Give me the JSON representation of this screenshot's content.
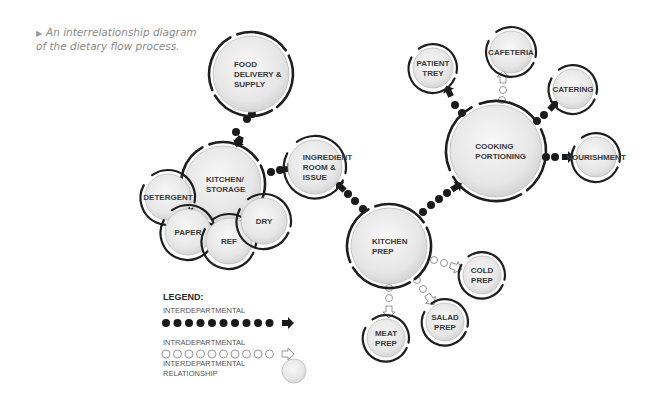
{
  "caption": {
    "marker": "▶",
    "text": "An interrelationship diagram of the dietary flow process."
  },
  "colors": {
    "node_fill_center": "#f6f6f6",
    "node_fill_edge": "#d4d4d4",
    "ring": "#1e1e1e",
    "inter_dot": "#1a1a1a",
    "intra_dot_stroke": "#8a8a8a",
    "label": "#3a3a3a"
  },
  "nodes": [
    {
      "id": "food-delivery",
      "lines": [
        "FOOD",
        "DELIVERY  &",
        "SUPPLY"
      ],
      "cx": 251,
      "cy": 74,
      "r": 38
    },
    {
      "id": "kitchen-storage",
      "lines": [
        "KITCHEN/",
        "STORAGE"
      ],
      "cx": 223,
      "cy": 184,
      "r": 38
    },
    {
      "id": "detergent",
      "lines": [
        "DETERGENT"
      ],
      "cx": 168,
      "cy": 197,
      "r": 23
    },
    {
      "id": "paper",
      "lines": [
        "PAPER"
      ],
      "cx": 188,
      "cy": 232,
      "r": 23
    },
    {
      "id": "ref",
      "lines": [
        "REF"
      ],
      "cx": 229,
      "cy": 241,
      "r": 23
    },
    {
      "id": "dry",
      "lines": [
        "DRY"
      ],
      "cx": 264,
      "cy": 221,
      "r": 23
    },
    {
      "id": "ingredient-room",
      "lines": [
        "INGREDIENT",
        "ROOM  &",
        "ISSUE"
      ],
      "cx": 315,
      "cy": 167,
      "r": 27
    },
    {
      "id": "kitchen-prep",
      "lines": [
        "KITCHEN",
        "PREP"
      ],
      "cx": 389,
      "cy": 246,
      "r": 38
    },
    {
      "id": "cooking-portioning",
      "lines": [
        "COOKING",
        "PORTIONING"
      ],
      "cx": 496,
      "cy": 151,
      "r": 46
    },
    {
      "id": "patient-trey",
      "lines": [
        "PATIENT",
        "TREY"
      ],
      "cx": 433,
      "cy": 68,
      "r": 20
    },
    {
      "id": "cafeteria",
      "lines": [
        "CAFETERIA"
      ],
      "cx": 511,
      "cy": 52,
      "r": 21
    },
    {
      "id": "catering",
      "lines": [
        "CATERING"
      ],
      "cx": 573,
      "cy": 89,
      "r": 20
    },
    {
      "id": "nourishment",
      "lines": [
        "NOURISHMENT"
      ],
      "cx": 596,
      "cy": 157,
      "r": 20
    },
    {
      "id": "cold-prep",
      "lines": [
        "COLD",
        "PREP"
      ],
      "cx": 482,
      "cy": 275,
      "r": 19
    },
    {
      "id": "salad-prep",
      "lines": [
        "SALAD",
        "PREP"
      ],
      "cx": 445,
      "cy": 322,
      "r": 19
    },
    {
      "id": "meat-prep",
      "lines": [
        "MEAT",
        "PREP"
      ],
      "cx": 386,
      "cy": 338,
      "r": 19
    }
  ],
  "connections": {
    "interdepartmental": [
      {
        "from": "kitchen-storage",
        "to": "food-delivery",
        "points": [
          [
            239,
            141
          ],
          [
            236,
            132
          ],
          [
            247,
            119
          ],
          [
            252,
            114
          ]
        ],
        "arrow_at": [
          239,
          141
        ]
      },
      {
        "from": "kitchen-storage",
        "to": "ingredient-room",
        "points": [
          [
            271,
            172
          ],
          [
            280,
            170
          ]
        ],
        "arrow_at": [
          287,
          169
        ]
      },
      {
        "from": "kitchen-prep",
        "to": "ingredient-room",
        "points": [
          [
            363,
            209
          ],
          [
            355,
            201
          ],
          [
            348,
            194
          ]
        ],
        "arrow_at": [
          341,
          187
        ]
      },
      {
        "from": "kitchen-prep",
        "to": "cooking-portioning",
        "points": [
          [
            423,
            212
          ],
          [
            431,
            205
          ],
          [
            439,
            199
          ],
          [
            447,
            193
          ]
        ],
        "arrow_at": [
          456,
          187
        ]
      },
      {
        "from": "cooking-portioning",
        "to": "patient-trey",
        "points": [
          [
            462,
            113
          ],
          [
            455,
            105
          ]
        ],
        "arrow_at": [
          449,
          92
        ]
      },
      {
        "from": "cooking-portioning",
        "to": "catering",
        "points": [
          [
            537,
            121
          ],
          [
            544,
            115
          ]
        ],
        "arrow_at": [
          553,
          106
        ]
      },
      {
        "from": "cooking-portioning",
        "to": "nourishment",
        "points": [
          [
            546,
            157
          ],
          [
            555,
            157
          ]
        ],
        "arrow_at": [
          567,
          157
        ]
      }
    ],
    "intradepartmental": [
      {
        "from": "cooking-portioning",
        "to": "cafeteria",
        "points": [
          [
            502,
            100
          ],
          [
            503,
            90
          ]
        ],
        "arrow_at": [
          503,
          78
        ]
      },
      {
        "from": "kitchen-prep",
        "to": "cold-prep",
        "points": [
          [
            434,
            260
          ],
          [
            444,
            263
          ]
        ],
        "arrow_at": [
          455,
          267
        ]
      },
      {
        "from": "kitchen-prep",
        "to": "salad-prep",
        "points": [
          [
            417,
            280
          ],
          [
            423,
            289
          ]
        ],
        "arrow_at": [
          430,
          299
        ]
      },
      {
        "from": "kitchen-prep",
        "to": "meat-prep",
        "points": [
          [
            389,
            288
          ],
          [
            389,
            298
          ]
        ],
        "arrow_at": [
          389,
          311
        ]
      }
    ]
  },
  "legend": {
    "title": "LEGEND:",
    "items": [
      {
        "label": "INTERDEPARTMENTAL",
        "style": "solid-dots-arrow"
      },
      {
        "label": "INTRADEPARTMENTAL",
        "style": "hollow-dots-arrow"
      },
      {
        "label_lines": [
          "INTERDEPARTMENTAL",
          "RELATIONSHIP"
        ],
        "style": "circle"
      }
    ]
  }
}
